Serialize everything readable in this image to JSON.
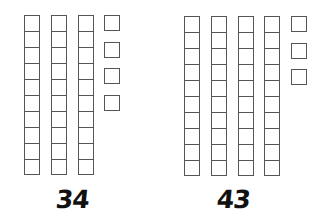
{
  "diagram": {
    "type": "base-ten-blocks",
    "groups": [
      {
        "label": "34",
        "tens": 3,
        "ones": 4
      },
      {
        "label": "43",
        "tens": 4,
        "ones": 3
      }
    ],
    "colors": {
      "stroke": "#555555",
      "background": "#ffffff",
      "text": "#111111"
    }
  }
}
